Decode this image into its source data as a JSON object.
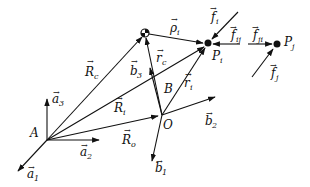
{
  "diagram": {
    "type": "vector-mechanics",
    "points": {
      "A": {
        "label": "A",
        "x": 47,
        "y": 140
      },
      "O": {
        "label": "O",
        "x": 162,
        "y": 115
      },
      "C": {
        "label": "",
        "x": 145,
        "y": 33
      },
      "Pi": {
        "label": "P",
        "sub": "i",
        "x": 208,
        "y": 43
      },
      "Pj": {
        "label": "P",
        "sub": "j",
        "x": 277,
        "y": 44
      },
      "B": {
        "label": "B",
        "x": 165,
        "y": 93
      }
    },
    "vectors": [
      {
        "id": "a1",
        "label": "a",
        "sub": "1",
        "from": [
          47,
          140
        ],
        "to": [
          17,
          172
        ]
      },
      {
        "id": "a2",
        "label": "a",
        "sub": "2",
        "from": [
          47,
          140
        ],
        "to": [
          100,
          140
        ]
      },
      {
        "id": "a3",
        "label": "a",
        "sub": "3",
        "from": [
          47,
          140
        ],
        "to": [
          47,
          98
        ]
      },
      {
        "id": "b1",
        "label": "b",
        "sub": "1",
        "from": [
          162,
          115
        ],
        "to": [
          151,
          162
        ]
      },
      {
        "id": "b2",
        "label": "b",
        "sub": "2",
        "from": [
          162,
          115
        ],
        "to": [
          216,
          97
        ]
      },
      {
        "id": "b3",
        "label": "b",
        "sub": "3",
        "from": [
          162,
          115
        ],
        "to": [
          150,
          67
        ]
      },
      {
        "id": "Rc",
        "label": "R",
        "sub": "c",
        "from": [
          47,
          140
        ],
        "to": [
          143,
          36
        ]
      },
      {
        "id": "Ri",
        "label": "R",
        "sub": "i",
        "from": [
          47,
          140
        ],
        "to": [
          205,
          46
        ]
      },
      {
        "id": "Ro",
        "label": "R",
        "sub": "o",
        "from": [
          47,
          140
        ],
        "to": [
          159,
          116
        ]
      },
      {
        "id": "rc",
        "label": "r",
        "sub": "c",
        "from": [
          162,
          115
        ],
        "to": [
          146,
          37
        ]
      },
      {
        "id": "ri",
        "label": "r",
        "sub": "i",
        "from": [
          162,
          115
        ],
        "to": [
          206,
          47
        ]
      },
      {
        "id": "rho_i",
        "label": "ρ",
        "sub": "i",
        "from": [
          148,
          34
        ],
        "to": [
          204,
          43
        ]
      },
      {
        "id": "fi",
        "label": "f",
        "sub": "i",
        "from": [
          238,
          12
        ],
        "to": [
          211,
          40
        ]
      },
      {
        "id": "fij",
        "label": "f",
        "sub": "ij",
        "from": [
          240,
          44
        ],
        "to": [
          212,
          44
        ]
      },
      {
        "id": "fji",
        "label": "f",
        "sub": "ji",
        "from": [
          248,
          44
        ],
        "to": [
          273,
          44
        ]
      },
      {
        "id": "fj",
        "label": "f",
        "sub": "j",
        "from": [
          252,
          77
        ],
        "to": [
          274,
          48
        ]
      }
    ],
    "labels": {
      "A": "A",
      "O": "O",
      "B": "B",
      "P": "P",
      "i": "i",
      "j": "j",
      "a": "a",
      "b": "b",
      "R": "R",
      "r": "r",
      "f": "f",
      "rho": "ρ",
      "s1": "1",
      "s2": "2",
      "s3": "3",
      "sc": "c",
      "so": "o",
      "sij": "ij",
      "sji": "ji"
    },
    "arrow": "→",
    "stroke_color": "#111111"
  }
}
